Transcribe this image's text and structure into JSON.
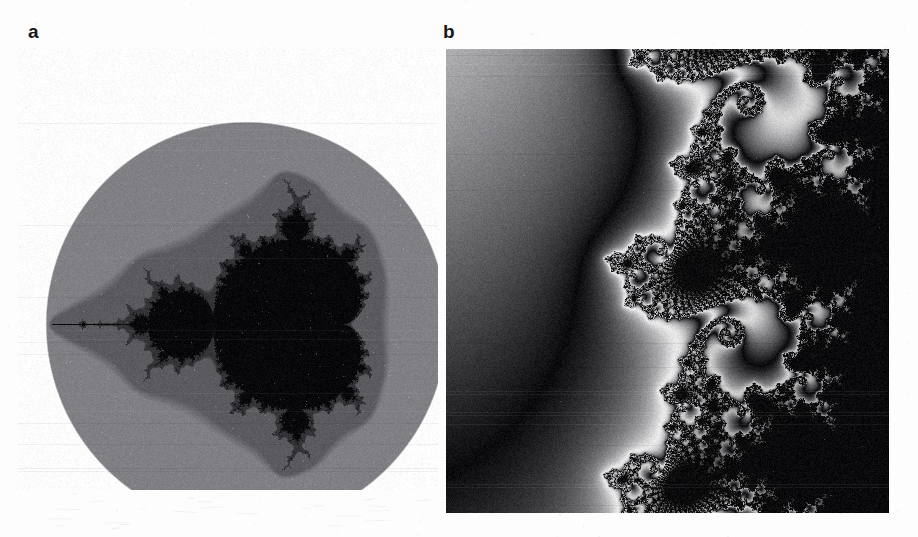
{
  "figure": {
    "background_color": "#fdfdfd",
    "width": 918,
    "height": 537,
    "panels": [
      {
        "id": "a",
        "label": "a",
        "label_x": 28,
        "label_y": 22,
        "subject": "mandelbrot-set-overview",
        "x": 18,
        "y": 48,
        "width": 420,
        "height": 442,
        "shape": "ellipse-vignette",
        "ellipse_center_x": 228,
        "ellipse_center_y": 276,
        "ellipse_radius_x": 201,
        "ellipse_radius_y": 203,
        "render": {
          "type": "mandelbrot",
          "orientation_deg": 90,
          "center_re": -0.5,
          "center_im": 0.0,
          "span_re": 3.1,
          "max_iter": 220,
          "interior_color": "#08080a",
          "outside_ellipse_color": "#fdfdfd"
        },
        "palette": [
          "#070709",
          "#121214",
          "#2a2a2d",
          "#4c4c50",
          "#6e6e72",
          "#8f8f93",
          "#b2b2b5",
          "#d4d4d6",
          "#efefef",
          "#fbfbfb"
        ],
        "features": [
          "main cardioid",
          "period-2 bulb",
          "period-3 bulbs",
          "satellite mini-mandelbrot on antenna",
          "needle antenna"
        ]
      },
      {
        "id": "b",
        "label": "b",
        "label_x": 443,
        "label_y": 22,
        "subject": "mandelbrot-set-deep-zoom",
        "x": 446,
        "y": 49,
        "width": 443,
        "height": 464,
        "shape": "rectangle",
        "render": {
          "type": "mandelbrot",
          "center_re": -0.748,
          "center_im": 0.1,
          "span_re": 0.0125,
          "max_iter": 420,
          "interior_color": "#0a0a0c",
          "band_period": 11
        },
        "palette": [
          "#0a0a0c",
          "#1d1d20",
          "#343438",
          "#4e4e52",
          "#69696d",
          "#848488",
          "#a0a0a4",
          "#bdbdc0",
          "#dadadc",
          "#f2f2f3",
          "#ffffff"
        ],
        "features": [
          "dendritic filaments",
          "seahorse-valley spirals",
          "mini-mandelbrot satellites",
          "large interior region lower-left"
        ]
      }
    ]
  },
  "scan": {
    "grain_opacity": 0.55,
    "paper_tone": "#fdfdfd",
    "ink_black": "#17171a"
  }
}
